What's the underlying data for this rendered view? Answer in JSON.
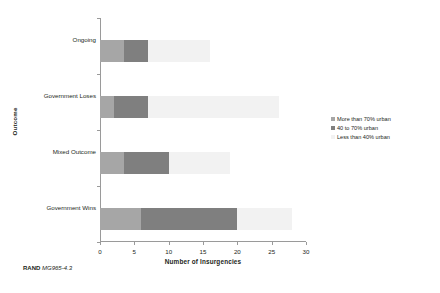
{
  "chart_data": {
    "type": "bar",
    "orientation": "horizontal",
    "stacked": true,
    "title": "",
    "xlabel": "Number of Insurgencies",
    "ylabel": "Outcome",
    "categories": [
      "Ongoing",
      "Government Loses",
      "Mixed Outcome",
      "Government Wins"
    ],
    "category_order_top_to_bottom": [
      "Ongoing",
      "Government Loses",
      "Mixed Outcome",
      "Government Wins"
    ],
    "series": [
      {
        "name": "More than 70% urban",
        "color": "#a6a6a6",
        "values": [
          3.5,
          2,
          3.5,
          6
        ]
      },
      {
        "name": "40 to 70% urban",
        "color": "#7f7f7f",
        "values": [
          3.5,
          5,
          6.5,
          14
        ]
      },
      {
        "name": "Less than 40% urban",
        "color": "#f2f2f2",
        "values": [
          9,
          19,
          9,
          8
        ]
      }
    ],
    "totals": [
      16,
      26,
      19,
      28
    ],
    "xlim": [
      0,
      30
    ],
    "xticks": [
      0,
      5,
      10,
      15,
      20,
      25,
      30
    ],
    "xtick_labels": [
      "0",
      "5",
      "10",
      "15",
      "20",
      "25",
      "30"
    ],
    "grid": false,
    "legend_position": "right"
  },
  "legend": {
    "items": [
      {
        "label": "More than 70% urban",
        "marker": "square-marker"
      },
      {
        "label": "40 to 70% urban",
        "marker": "square-marker"
      },
      {
        "label": "Less than 40% urban",
        "marker": "square-marker"
      }
    ]
  },
  "caption": {
    "source": "RAND",
    "figure_id": "MG965-4.3"
  },
  "colors": {
    "series_more_than_70": "#a6a6a6",
    "series_40_to_70": "#7f7f7f",
    "series_less_than_40": "#f2f2f2",
    "axis": "#9a9a9a",
    "text": "#231f20",
    "background": "#ffffff"
  }
}
